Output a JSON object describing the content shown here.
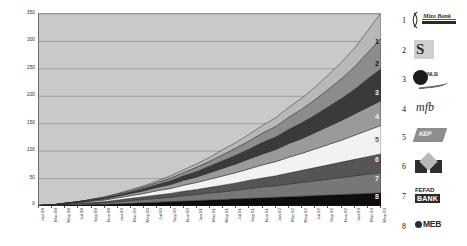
{
  "chart_data": {
    "type": "area",
    "stacked": true,
    "title": "",
    "xlabel": "",
    "ylabel": "",
    "ylim": [
      0,
      350
    ],
    "y_ticks": [
      0,
      50,
      100,
      150,
      200,
      250,
      300,
      350
    ],
    "grid": true,
    "legend_position": "right",
    "categories": [
      "Jan 99",
      "Mar 99",
      "May 99",
      "Jul 99",
      "Sep 99",
      "Nov 99",
      "Jan 00",
      "Mar 00",
      "May 00",
      "Jul 00",
      "Sep 00",
      "Nov 00",
      "Jan 01",
      "Mar 01",
      "May 01",
      "Jul 01",
      "Sep 01",
      "Nov 01",
      "Jan 02",
      "Mar 02",
      "May 02",
      "Jul 02",
      "Sep 02",
      "Nov 02",
      "Jan 03",
      "Mar 03",
      "May 03"
    ],
    "series": [
      {
        "name": "MEB",
        "legend_number": "8",
        "color": "#0d0d0d",
        "values": [
          1,
          1,
          2,
          2,
          3,
          3,
          4,
          5,
          6,
          7,
          8,
          9,
          10,
          11,
          12,
          13,
          14,
          15,
          16,
          17,
          18,
          19,
          20,
          21,
          22,
          23,
          24
        ]
      },
      {
        "name": "FEFAD BANK",
        "legend_number": "7",
        "color": "#777777",
        "values": [
          0,
          1,
          1,
          2,
          2,
          3,
          4,
          5,
          6,
          7,
          8,
          10,
          11,
          13,
          14,
          16,
          18,
          20,
          21,
          23,
          25,
          27,
          29,
          31,
          33,
          35,
          37
        ]
      },
      {
        "name": "MEB Group",
        "legend_number": "6",
        "color": "#555555",
        "values": [
          0,
          0,
          1,
          1,
          2,
          2,
          3,
          4,
          5,
          6,
          7,
          8,
          9,
          10,
          12,
          13,
          15,
          16,
          18,
          20,
          22,
          24,
          26,
          28,
          30,
          32,
          34
        ]
      },
      {
        "name": "Banco Sol",
        "legend_number": "5",
        "color": "#f2f2f2",
        "values": [
          0,
          0,
          1,
          1,
          2,
          3,
          4,
          5,
          6,
          8,
          9,
          11,
          13,
          15,
          17,
          19,
          21,
          24,
          26,
          29,
          31,
          34,
          37,
          40,
          44,
          48,
          52
        ]
      },
      {
        "name": "mfb",
        "legend_number": "4",
        "color": "#9a9a9a",
        "values": [
          0,
          0,
          0,
          1,
          1,
          2,
          3,
          4,
          5,
          6,
          7,
          9,
          10,
          12,
          14,
          16,
          18,
          20,
          22,
          25,
          27,
          30,
          33,
          36,
          39,
          42,
          45
        ]
      },
      {
        "name": "NovoBanco",
        "legend_number": "3",
        "color": "#3a3a3a",
        "values": [
          0,
          0,
          0,
          1,
          1,
          2,
          2,
          3,
          4,
          5,
          7,
          8,
          10,
          12,
          14,
          16,
          18,
          21,
          23,
          26,
          29,
          32,
          36,
          40,
          45,
          52,
          58
        ]
      },
      {
        "name": "ProCredit",
        "legend_number": "2",
        "color": "#8c8c8c",
        "values": [
          0,
          0,
          0,
          0,
          1,
          1,
          2,
          2,
          3,
          4,
          5,
          6,
          8,
          9,
          11,
          13,
          15,
          17,
          19,
          22,
          25,
          28,
          32,
          36,
          41,
          48,
          56
        ]
      },
      {
        "name": "Mizo Bank",
        "legend_number": "1",
        "color": "#b8b8b8",
        "values": [
          0,
          0,
          0,
          0,
          0,
          1,
          1,
          2,
          2,
          3,
          4,
          5,
          6,
          7,
          9,
          10,
          12,
          14,
          16,
          18,
          20,
          23,
          26,
          30,
          34,
          40,
          46
        ]
      }
    ]
  },
  "y_axis": {
    "ticks": [
      "350",
      "300",
      "250",
      "200",
      "150",
      "100",
      "50",
      "0"
    ]
  },
  "x_axis": {
    "labels": [
      "Jan 99",
      "Mar 99",
      "May 99",
      "Jul 99",
      "Sep 99",
      "Nov 99",
      "Jan 00",
      "Mar 00",
      "May 00",
      "Jul 00",
      "Sep 00",
      "Nov 00",
      "Jan 01",
      "Mar 01",
      "May 01",
      "Jul 01",
      "Sep 01",
      "Nov 01",
      "Jan 02",
      "Mar 02",
      "May 02",
      "Jul 02",
      "Sep 02",
      "Nov 02",
      "Jan 03",
      "Mar 03",
      "May 03"
    ]
  },
  "band_labels": [
    "1",
    "2",
    "3",
    "4",
    "5",
    "6",
    "7",
    "8"
  ],
  "legend": {
    "items": [
      {
        "number": "1",
        "name": "Mizo Bank",
        "logo": "mizo-bank-logo",
        "text": "Mizo Bank"
      },
      {
        "number": "2",
        "name": "spiral-mark",
        "logo": "spiral-logo",
        "text": "S"
      },
      {
        "number": "3",
        "name": "dot-swoosh",
        "logo": "dot-swoosh-logo",
        "text": "NLB"
      },
      {
        "number": "4",
        "name": "mfb",
        "logo": "mfb-logo",
        "text": "mfb"
      },
      {
        "number": "5",
        "name": "slanted-mark",
        "logo": "slanted-logo",
        "text": "KEP"
      },
      {
        "number": "6",
        "name": "house-mark",
        "logo": "house-logo",
        "text": ""
      },
      {
        "number": "7",
        "name": "FEFAD BANK",
        "logo": "fefad-bank-logo",
        "text_top": "FEFAD",
        "text_box": "BANK"
      },
      {
        "number": "8",
        "name": "MEB",
        "logo": "meb-logo",
        "text": "MEB"
      }
    ]
  },
  "colors": {
    "plot_background": "#c9c9c9",
    "gridline": "#8d8d8d",
    "page_background": "#ffffff"
  }
}
